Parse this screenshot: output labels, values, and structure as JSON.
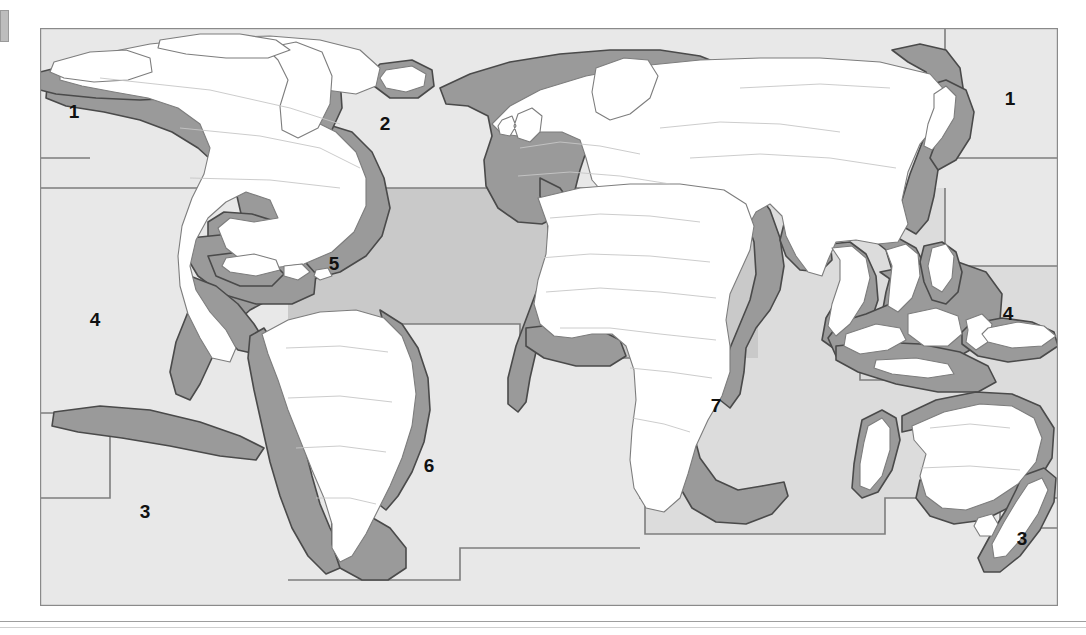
{
  "map": {
    "title": "World map of marine fishing regions",
    "frame": {
      "x": 40,
      "y": 28,
      "width": 1018,
      "height": 578,
      "border_color": "#8a8a8a"
    },
    "colors": {
      "land": "#ffffff",
      "land_outline": "#808080",
      "country_border": "#b9b9b9",
      "shelf": "#9a9a9a",
      "shelf_outline": "#4a4a4a",
      "ocean_light": "#e8e8e8",
      "ocean_mid": "#dcdcdc",
      "ocean_dark": "#c9c9c9",
      "region_border": "#7d7d7d",
      "label": "#111111",
      "page_background": "#ffffff"
    },
    "regions": [
      {
        "id": "region-1-north-pacific-west",
        "label": "1",
        "x": 34,
        "y": 85,
        "tone": "ocean_light"
      },
      {
        "id": "region-1-north-pacific-east",
        "label": "1",
        "x": 970,
        "y": 72,
        "tone": "ocean_light"
      },
      {
        "id": "region-2-north-atlantic",
        "label": "2",
        "x": 345,
        "y": 97,
        "tone": "ocean_light"
      },
      {
        "id": "region-3-south-pacific-east",
        "label": "3",
        "x": 105,
        "y": 485,
        "tone": "ocean_light"
      },
      {
        "id": "region-3-south-pacific-west",
        "label": "3",
        "x": 982,
        "y": 512,
        "tone": "ocean_light"
      },
      {
        "id": "region-4-tropical-pacific-east",
        "label": "4",
        "x": 55,
        "y": 293,
        "tone": "ocean_light"
      },
      {
        "id": "region-4-tropical-pacific-west",
        "label": "4",
        "x": 968,
        "y": 287,
        "tone": "ocean_light"
      },
      {
        "id": "region-5-tropical-atlantic",
        "label": "5",
        "x": 294,
        "y": 237,
        "tone": "ocean_dark"
      },
      {
        "id": "region-6-south-atlantic",
        "label": "6",
        "x": 389,
        "y": 439,
        "tone": "ocean_light"
      },
      {
        "id": "region-7-indian-ocean",
        "label": "7",
        "x": 676,
        "y": 379,
        "tone": "ocean_mid"
      }
    ],
    "legend_numbers": [
      "1",
      "2",
      "3",
      "4",
      "5",
      "6",
      "7"
    ],
    "shelf_note": "dark grey band = continental shelf / coastal zone"
  }
}
